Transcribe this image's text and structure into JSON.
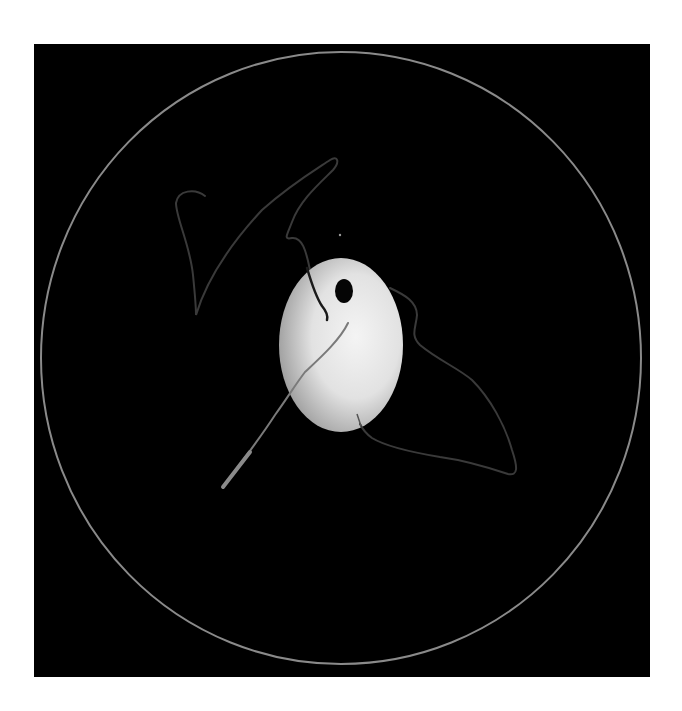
{
  "scene": {
    "description": "Microscopy-style image: a bright oval cell (egg) with a dark nucleus-like spot on a black circular field, with faint filament traces",
    "background_color": "#ffffff",
    "frame": {
      "x": 34,
      "y": 44,
      "width": 616,
      "height": 633,
      "color": "#000000"
    },
    "field_circle": {
      "cx": 341,
      "cy": 358,
      "rx": 300,
      "ry": 306,
      "stroke": "#8a8a8a"
    },
    "egg": {
      "cx": 341,
      "cy": 345,
      "rx": 62,
      "ry": 87,
      "highlight": "#f2f2f2",
      "shadow": "#9a9a9a"
    },
    "nucleus": {
      "cx": 344,
      "cy": 291,
      "rx": 9,
      "ry": 12,
      "color": "#050505"
    },
    "speck": {
      "cx": 340,
      "cy": 235,
      "r": 1.2,
      "color": "#9a9a9a"
    },
    "filaments": {
      "left_loop_color": "#3a3a3a",
      "right_loop_color": "#3a3a3a",
      "tail_color": "#7a7a7a",
      "inner_dark_color": "#1a1a1a"
    }
  }
}
